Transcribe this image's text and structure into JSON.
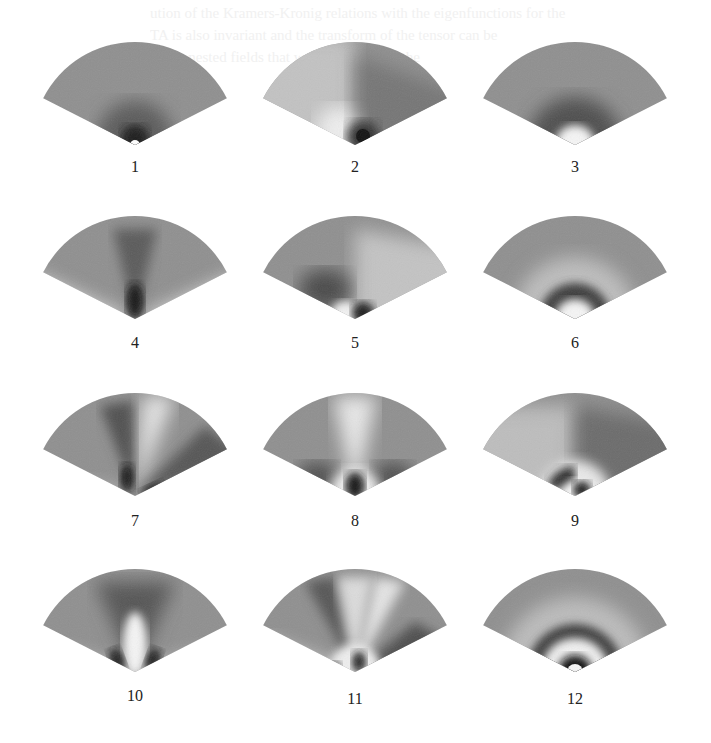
{
  "figure": {
    "background_text_lines": [
      "ution of the Kramers-Kronig relations with the eigenfunctions for the",
      "TA is also invariant and the transform of the tensor can be",
      "of the nested fields that we can use to see the"
    ],
    "panels": [
      {
        "label": "1",
        "pattern": "apex-spot"
      },
      {
        "label": "2",
        "pattern": "split-half-dark-right"
      },
      {
        "label": "3",
        "pattern": "ring-dark-around-bright-core"
      },
      {
        "label": "4",
        "pattern": "central-dark-lobe"
      },
      {
        "label": "5",
        "pattern": "split-half-dark-left-with-core"
      },
      {
        "label": "6",
        "pattern": "single-dark-ring"
      },
      {
        "label": "7",
        "pattern": "two-dark-lobes"
      },
      {
        "label": "8",
        "pattern": "three-lobes-with-core"
      },
      {
        "label": "9",
        "pattern": "split-ring-with-core"
      },
      {
        "label": "10",
        "pattern": "two-dark-lobes-bright-center"
      },
      {
        "label": "11",
        "pattern": "four-lobes-with-core"
      },
      {
        "label": "12",
        "pattern": "double-dark-ring"
      }
    ]
  },
  "colors": {
    "fan_base": "#8f8f8f",
    "dark": "#1a1a1a",
    "bright": "#f2f2f2",
    "label": "#222222"
  }
}
